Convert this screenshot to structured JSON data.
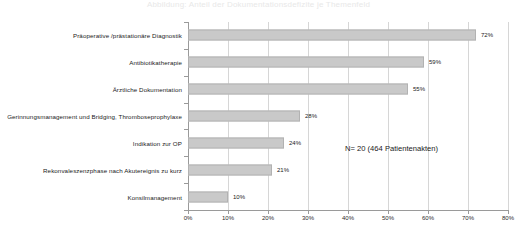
{
  "title_strip": "Abbildung: Anteil der Dokumentationsdefizite je Themenfeld",
  "annotation": "N= 20 (464 Patientenakten)",
  "axis": {
    "tick_labels": [
      "0%",
      "10%",
      "20%",
      "30%",
      "40%",
      "50%",
      "60%",
      "70%",
      "80%"
    ],
    "min": 0,
    "max": 80,
    "step": 10
  },
  "colors": {
    "bar_fill": "#c9c9c9",
    "bar_border": "#b2b2b2",
    "gridline": "#d6d6d6",
    "axis": "#9a9a9a",
    "text": "#1a1a1a",
    "background": "#ffffff"
  },
  "chart_data": {
    "type": "bar",
    "orientation": "horizontal",
    "title": "",
    "xlabel": "",
    "ylabel": "",
    "xlim": [
      0,
      80
    ],
    "grid": true,
    "legend": "none",
    "value_suffix": "%",
    "categories": [
      "Präoperative /prästationäre Diagnostik",
      "Antibiotikatherapie",
      "Ärztliche Dokumentation",
      "Gerinnungsmanagement und Bridging, Thromboseprophylaxe",
      "Indikation zur OP",
      "Rekonvaleszenzphase nach Akutereignis zu kurz",
      "Konsilmanagement"
    ],
    "values": [
      72,
      59,
      55,
      28,
      24,
      21,
      10
    ],
    "value_labels": [
      "72%",
      "59%",
      "55%",
      "28%",
      "24%",
      "21%",
      "10%"
    ],
    "annotations": [
      "N= 20 (464 Patientenakten)"
    ]
  }
}
